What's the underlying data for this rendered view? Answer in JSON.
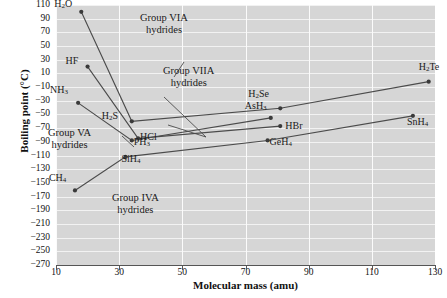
{
  "chart_data": {
    "type": "line",
    "title": "",
    "xlabel": "Molecular mass (amu)",
    "ylabel": "Boiling point (°C)",
    "xlim": [
      10,
      130
    ],
    "ylim": [
      -270,
      110
    ],
    "xticks": [
      10,
      30,
      50,
      70,
      90,
      110,
      130
    ],
    "yticks": [
      110,
      90,
      70,
      50,
      30,
      10,
      -10,
      -30,
      -50,
      -70,
      -90,
      -110,
      -130,
      -150,
      -170,
      -190,
      -210,
      -230,
      -250,
      -270
    ],
    "grid": true,
    "legend_position": "inline-annotations",
    "series": [
      {
        "name": "Group VIA hydrides",
        "points": [
          {
            "label": "H2O",
            "label_html": "H<sub>2</sub>O",
            "x": 18,
            "y": 100
          },
          {
            "label": "H2S",
            "label_html": "H<sub>2</sub>S",
            "x": 34,
            "y": -60
          },
          {
            "label": "H2Se",
            "label_html": "H<sub>2</sub>Se",
            "x": 81,
            "y": -41
          },
          {
            "label": "H2Te",
            "label_html": "H<sub>2</sub>Te",
            "x": 128,
            "y": -2
          }
        ]
      },
      {
        "name": "Group VIIA hydrides",
        "points": [
          {
            "label": "HF",
            "label_html": "HF",
            "x": 20,
            "y": 20
          },
          {
            "label": "HCl",
            "label_html": "HCl",
            "x": 36,
            "y": -85
          },
          {
            "label": "HBr",
            "label_html": "HBr",
            "x": 81,
            "y": -67
          },
          {
            "label": "HI",
            "label_html": "HI",
            "x": 128,
            "y": -35
          }
        ]
      },
      {
        "name": "Group VA hydrides",
        "points": [
          {
            "label": "NH3",
            "label_html": "NH<sub>3</sub>",
            "x": 17,
            "y": -33
          },
          {
            "label": "PH3",
            "label_html": "PH<sub>3</sub>",
            "x": 34,
            "y": -88
          },
          {
            "label": "AsH3",
            "label_html": "AsH<sub>3</sub>",
            "x": 78,
            "y": -55
          },
          {
            "label": "SbH3",
            "label_html": "SbH<sub>3</sub>",
            "x": 125,
            "y": -17
          }
        ]
      },
      {
        "name": "Group IVA hydrides",
        "points": [
          {
            "label": "CH4",
            "label_html": "CH<sub>4</sub>",
            "x": 16,
            "y": -161
          },
          {
            "label": "SiH4",
            "label_html": "SiH<sub>4</sub>",
            "x": 32,
            "y": -112
          },
          {
            "label": "GeH4",
            "label_html": "GeH<sub>4</sub>",
            "x": 77,
            "y": -88
          },
          {
            "label": "SnH4",
            "label_html": "SnH<sub>4</sub>",
            "x": 123,
            "y": -52
          }
        ]
      }
    ],
    "annotations": [
      {
        "name": "group-via-annotation",
        "line1": "Group VIA",
        "line2": "hydrides"
      },
      {
        "name": "group-viia-annotation",
        "line1": "Group VIIA",
        "line2": "hydrides"
      },
      {
        "name": "group-va-annotation",
        "line1": "Group VA",
        "line2": "hydrides"
      },
      {
        "name": "group-iva-annotation",
        "line1": "Group IVA",
        "line2": "hydrides"
      }
    ],
    "point_labels": [
      {
        "name": "point-label-h2o",
        "text": "H₂O"
      },
      {
        "name": "point-label-hf",
        "text": "HF"
      },
      {
        "name": "point-label-nh3",
        "text": "NH₃"
      },
      {
        "name": "point-label-h2s",
        "text": "H₂S"
      },
      {
        "name": "point-label-hcl",
        "text": "HCl"
      },
      {
        "name": "point-label-ph3",
        "text": "PH₃"
      },
      {
        "name": "point-label-sih4",
        "text": "SiH₄"
      },
      {
        "name": "point-label-ch4",
        "text": "CH₄"
      },
      {
        "name": "point-label-h2se",
        "text": "H₂Se"
      },
      {
        "name": "point-label-ash3",
        "text": "AsH₃"
      },
      {
        "name": "point-label-hbr",
        "text": "HBr"
      },
      {
        "name": "point-label-geh4",
        "text": "GeH₄"
      },
      {
        "name": "point-label-h2te",
        "text": "H₂Te"
      },
      {
        "name": "point-label-snh4",
        "text": "SnH₄"
      }
    ],
    "colors": {
      "plot_background": "#d6d6d6",
      "gridline": "#f2f2f2",
      "series_line": "#4b4b4b",
      "marker": "#3a3a3a",
      "axis": "#555555",
      "text": "#1a1a1a"
    }
  },
  "axes": {
    "y_title": "Boiling point (°C)",
    "x_title": "Molecular mass (amu)",
    "y_ticks": [
      "110",
      "90",
      "70",
      "50",
      "30",
      "10",
      "−10",
      "−30",
      "−50",
      "−70",
      "−90",
      "−110",
      "−130",
      "−150",
      "−170",
      "−190",
      "−210",
      "−230",
      "−250",
      "−270"
    ],
    "x_ticks": [
      "10",
      "30",
      "50",
      "70",
      "90",
      "110",
      "130"
    ]
  }
}
